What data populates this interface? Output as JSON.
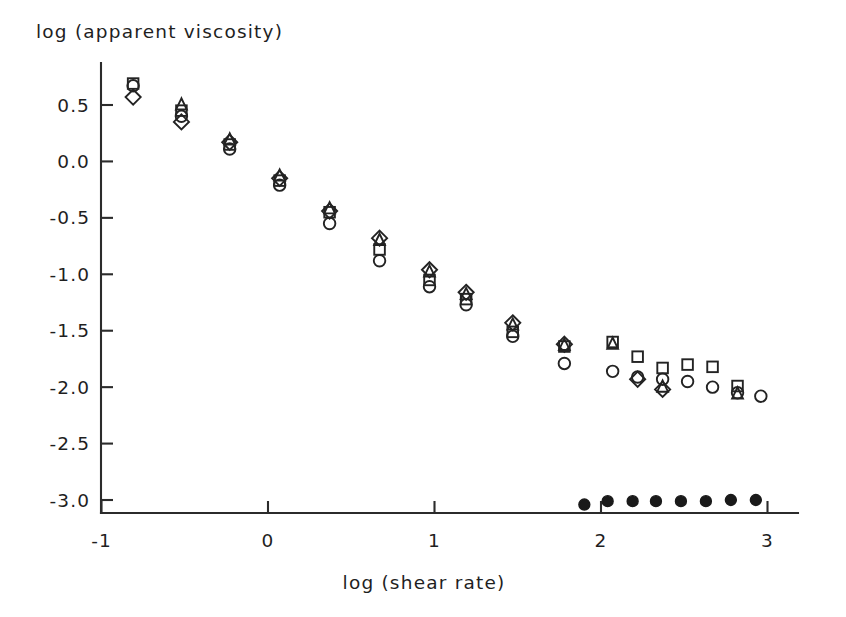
{
  "figure": {
    "y_axis_title": "log (apparent viscosity)",
    "x_axis_title": "log (shear rate)"
  },
  "chart_data": {
    "type": "scatter",
    "title": "",
    "xlabel": "log (shear rate)",
    "ylabel": "log (apparent viscosity)",
    "xlim": [
      -1.0,
      3.15
    ],
    "ylim": [
      -3.25,
      0.85
    ],
    "xticks": [
      -1,
      0,
      1,
      2,
      3
    ],
    "xticklabels": [
      "-1",
      "0",
      "1",
      "2",
      "3"
    ],
    "yticks": [
      0.5,
      0.0,
      -0.5,
      -1.0,
      -1.5,
      -2.0,
      -2.5,
      -3.0
    ],
    "yticklabels": [
      "0.5",
      "0.0",
      "-0.5",
      "-1.0",
      "-1.5",
      "-2.0",
      "-2.5",
      "-3.0"
    ],
    "grid": false,
    "legend": "none",
    "marker_shapes": [
      "circle",
      "square",
      "triangle",
      "diamond",
      "filled-circle"
    ],
    "series": [
      {
        "name": "circle",
        "marker": "circle",
        "filled": false,
        "points": [
          [
            -0.81,
            0.67
          ],
          [
            -0.52,
            0.4
          ],
          [
            -0.23,
            0.11
          ],
          [
            0.07,
            -0.21
          ],
          [
            0.37,
            -0.55
          ],
          [
            0.67,
            -0.88
          ],
          [
            0.97,
            -1.11
          ],
          [
            1.19,
            -1.27
          ],
          [
            1.47,
            -1.55
          ],
          [
            1.78,
            -1.79
          ],
          [
            2.07,
            -1.86
          ],
          [
            2.22,
            -1.91
          ],
          [
            2.37,
            -1.93
          ],
          [
            2.52,
            -1.95
          ],
          [
            2.67,
            -2.0
          ],
          [
            2.82,
            -2.05
          ],
          [
            2.96,
            -2.08
          ]
        ]
      },
      {
        "name": "square",
        "marker": "square",
        "filled": false,
        "points": [
          [
            -0.81,
            0.69
          ],
          [
            -0.52,
            0.45
          ],
          [
            -0.23,
            0.15
          ],
          [
            0.07,
            -0.17
          ],
          [
            0.37,
            -0.45
          ],
          [
            0.67,
            -0.78
          ],
          [
            0.97,
            -1.05
          ],
          [
            1.19,
            -1.22
          ],
          [
            1.47,
            -1.51
          ],
          [
            1.78,
            -1.64
          ],
          [
            2.07,
            -1.6
          ],
          [
            2.22,
            -1.73
          ],
          [
            2.37,
            -1.83
          ],
          [
            2.52,
            -1.8
          ],
          [
            2.67,
            -1.82
          ],
          [
            2.82,
            -1.99
          ]
        ]
      },
      {
        "name": "triangle",
        "marker": "triangle",
        "filled": false,
        "points": [
          [
            -0.52,
            0.5
          ],
          [
            -0.23,
            0.19
          ],
          [
            0.07,
            -0.13
          ],
          [
            0.37,
            -0.42
          ],
          [
            0.67,
            -0.7
          ],
          [
            0.97,
            -0.98
          ],
          [
            1.19,
            -1.18
          ],
          [
            1.47,
            -1.45
          ],
          [
            1.78,
            -1.63
          ],
          [
            2.07,
            -1.62
          ],
          [
            2.37,
            -2.0
          ],
          [
            2.82,
            -2.06
          ]
        ]
      },
      {
        "name": "diamond",
        "marker": "diamond",
        "filled": false,
        "points": [
          [
            -0.81,
            0.57
          ],
          [
            -0.52,
            0.35
          ],
          [
            -0.23,
            0.17
          ],
          [
            0.07,
            -0.15
          ],
          [
            0.37,
            -0.44
          ],
          [
            0.67,
            -0.68
          ],
          [
            0.97,
            -0.96
          ],
          [
            1.19,
            -1.16
          ],
          [
            1.47,
            -1.43
          ],
          [
            1.78,
            -1.62
          ],
          [
            2.22,
            -1.93
          ],
          [
            2.37,
            -2.02
          ]
        ]
      },
      {
        "name": "filled-circle",
        "marker": "filled-circle",
        "filled": true,
        "points": [
          [
            1.9,
            -3.04
          ],
          [
            2.04,
            -3.01
          ],
          [
            2.19,
            -3.01
          ],
          [
            2.33,
            -3.01
          ],
          [
            2.48,
            -3.01
          ],
          [
            2.63,
            -3.01
          ],
          [
            2.78,
            -3.0
          ],
          [
            2.93,
            -3.0
          ]
        ]
      }
    ]
  },
  "style": {
    "axis_color": "#2b2b2b",
    "marker_color": "#232323",
    "filled_marker_color": "#1a1a1a",
    "text_color": "#1f1f1f",
    "background": "#ffffff"
  }
}
